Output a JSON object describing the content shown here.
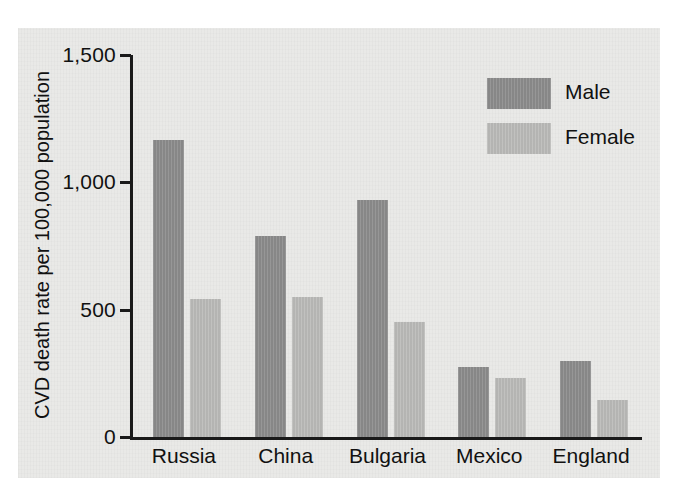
{
  "chart_data": {
    "type": "bar",
    "title": "",
    "xlabel": "",
    "ylabel": "CVD death rate per 100,000 population",
    "ylim": [
      0,
      1500
    ],
    "yticks": [
      0,
      500,
      1000,
      1500
    ],
    "ytick_labels": [
      "0",
      "500",
      "1,000",
      "1,500"
    ],
    "grid": false,
    "legend_position": "top-right",
    "categories": [
      "Russia",
      "China",
      "Bulgaria",
      "Mexico",
      "England"
    ],
    "series": [
      {
        "name": "Male",
        "color": "#8b8b8b",
        "values": [
          1165,
          790,
          930,
          275,
          300
        ]
      },
      {
        "name": "Female",
        "color": "#babab8",
        "values": [
          540,
          550,
          450,
          230,
          145
        ]
      }
    ]
  },
  "colors": {
    "panel_background": "#e9e9e7",
    "page_background": "#ffffff",
    "axis": "#1a1a1a",
    "text": "#111111",
    "male_bar": "#8b8b8b",
    "female_bar": "#babab8"
  }
}
